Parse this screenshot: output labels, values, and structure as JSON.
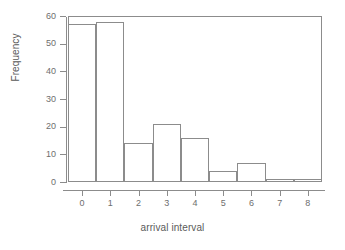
{
  "chart_data": {
    "type": "bar",
    "title": "",
    "subtitle": "",
    "xlabel": "arrival interval",
    "ylabel": "Frequency",
    "categories": [
      "0",
      "1",
      "2",
      "3",
      "4",
      "5",
      "6",
      "7",
      "8"
    ],
    "values": [
      57,
      58,
      14,
      21,
      16,
      4,
      7,
      1,
      1
    ],
    "series": [
      {
        "name": "Frequency",
        "values": [
          57,
          58,
          14,
          21,
          16,
          4,
          7,
          1,
          1
        ]
      }
    ],
    "xlim": [
      -0.5,
      8.5
    ],
    "ylim": [
      0,
      60
    ],
    "ytick_labels": [
      "0",
      "10",
      "20",
      "30",
      "40",
      "50",
      "60"
    ],
    "ytick_values": [
      0,
      10,
      20,
      30,
      40,
      50,
      60
    ],
    "xtick_labels": [
      "0",
      "1",
      "2",
      "3",
      "4",
      "5",
      "6",
      "7",
      "8"
    ],
    "xtick_values": [
      0,
      1,
      2,
      3,
      4,
      5,
      6,
      7,
      8
    ],
    "grid": false,
    "legend": false,
    "legend_position": "none",
    "bar_fill_color": "#ffffff",
    "bar_border_color": "#8c8c8c",
    "axis_color": "#8c8c8c",
    "text_color": "#6e6e6e",
    "background_color": "#ffffff"
  }
}
